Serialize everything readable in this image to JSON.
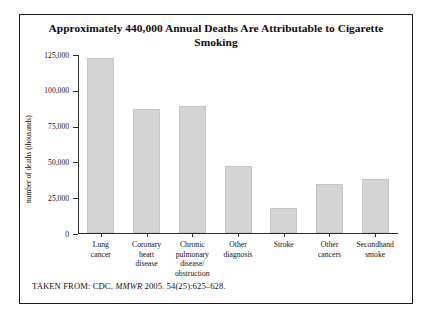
{
  "figure": {
    "title": "Approximately 440,000 Annual Deaths Are Attributable to Cigarette Smoking",
    "source_prefix": "TAKEN FROM: CDC,",
    "source_italic": "MMWR",
    "source_suffix": "2005. 54(25):625–628."
  },
  "chart_data": {
    "type": "bar",
    "title": "Approximately 440,000 Annual Deaths Are Attributable to Cigarette Smoking",
    "xlabel": "",
    "ylabel": "number of deaths (thousands)",
    "categories": [
      "Lung cancer",
      "Coronary heart disease",
      "Chronic pulmonary disease/obstruction",
      "Other diagnosis",
      "Stroke",
      "Other cancers",
      "Secondhand smoke"
    ],
    "category_lines": [
      [
        "Lung",
        "cancer"
      ],
      [
        "Coronary",
        "heart",
        "disease"
      ],
      [
        "Chronic",
        "pulmonary",
        "disease/",
        "obstruction"
      ],
      [
        "Other",
        "diagnosis"
      ],
      [
        "Stroke"
      ],
      [
        "Other",
        "cancers"
      ],
      [
        "Secondhand",
        "smoke"
      ]
    ],
    "values": [
      123000,
      87000,
      89000,
      47000,
      17500,
      34000,
      38000
    ],
    "ylim": [
      0,
      125000
    ],
    "yticks": [
      0,
      25000,
      50000,
      75000,
      100000,
      125000
    ],
    "ytick_labels": [
      "0",
      "25,000",
      "50,000",
      "75,000",
      "100,000",
      "125,000"
    ],
    "grid": false,
    "legend": false,
    "bar_color": "#d4d4d4",
    "axis_color": "#2b2b2b"
  }
}
